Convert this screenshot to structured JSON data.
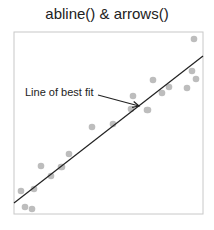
{
  "chart_data": {
    "type": "scatter",
    "title": "abline() & arrows()",
    "xlabel": "",
    "ylabel": "",
    "grid": false,
    "axes_visible": false,
    "plot_box_px": {
      "left": 14,
      "top": 32,
      "right": 203,
      "bottom": 214
    },
    "points_px": [
      [
        21,
        191
      ],
      [
        25,
        207
      ],
      [
        32,
        209
      ],
      [
        34,
        189
      ],
      [
        41,
        166
      ],
      [
        51,
        176
      ],
      [
        61,
        167
      ],
      [
        62,
        167
      ],
      [
        69,
        154
      ],
      [
        92,
        127
      ],
      [
        113,
        124
      ],
      [
        131,
        109
      ],
      [
        133,
        96
      ],
      [
        147,
        110
      ],
      [
        148,
        110
      ],
      [
        153,
        80
      ],
      [
        162,
        93
      ],
      [
        169,
        87
      ],
      [
        187,
        88
      ],
      [
        192,
        71
      ],
      [
        196,
        79
      ],
      [
        194,
        39
      ]
    ],
    "fit_line_px": {
      "x1": 14,
      "y1": 203,
      "x2": 203,
      "y2": 56
    },
    "annotation": {
      "text": "Line of best fit",
      "text_x": 25,
      "text_y": 96,
      "arrow_from": [
        98,
        95
      ],
      "arrow_to": [
        139,
        106
      ]
    },
    "colors": {
      "points": "#bdbdbd",
      "line": "#222222",
      "box": "#c8c8c8"
    }
  }
}
